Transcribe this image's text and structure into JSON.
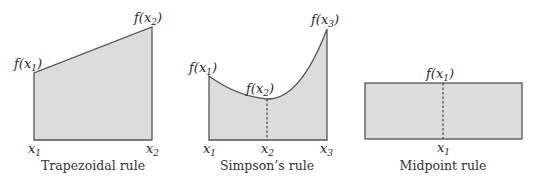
{
  "colors": {
    "fill": "#dcdcdc",
    "stroke": "#555555",
    "background": "#ffffff"
  },
  "panels": [
    {
      "caption": "Trapezoidal rule",
      "labels": {
        "f1": "f(",
        "f1_var": "x",
        "f1_sub": "1",
        "f2_var": "x",
        "f2_sub": "2",
        "x1_var": "x",
        "x1_sub": "1",
        "x2_var": "x",
        "x2_sub": "2"
      }
    },
    {
      "caption": "Simpson’s rule",
      "labels": {
        "f1_var": "x",
        "f1_sub": "1",
        "f2_var": "x",
        "f2_sub": "2",
        "f3_var": "x",
        "f3_sub": "3",
        "x1_var": "x",
        "x1_sub": "1",
        "x2_var": "x",
        "x2_sub": "2",
        "x3_var": "x",
        "x3_sub": "3"
      }
    },
    {
      "caption": "Midpoint rule",
      "labels": {
        "f1_var": "x",
        "f1_sub": "1",
        "x1_var": "x",
        "x1_sub": "1"
      }
    }
  ],
  "text": {
    "f_open": "f(",
    "close": ")"
  }
}
